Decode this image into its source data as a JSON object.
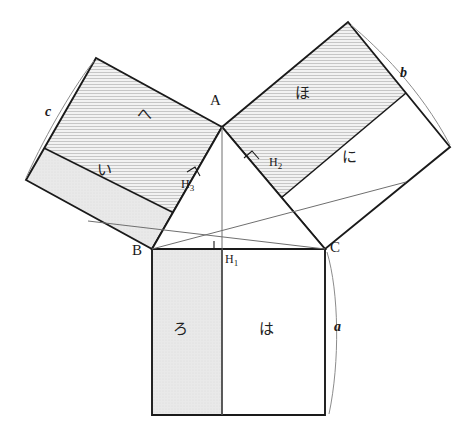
{
  "figure": {
    "canvas": {
      "width": 466,
      "height": 435,
      "background": "#ffffff"
    }
  },
  "colors": {
    "stroke_heavy": "#1a1a1a",
    "stroke_light": "#777777",
    "fill_white": "#ffffff",
    "fill_shaded": "#e6e6e6",
    "fill_hatched": "#ececec",
    "hatch_line": "#9a9a9a",
    "text": "#1a1a1a"
  },
  "vertices": [
    {
      "name": "A",
      "label": "A",
      "x": 222,
      "y": 127,
      "label_x": 214,
      "label_y": 100
    },
    {
      "name": "B",
      "label": "B",
      "x": 152,
      "y": 249,
      "label_x": 135,
      "label_y": 252
    },
    {
      "name": "C",
      "label": "C",
      "x": 325,
      "y": 249,
      "label_x": 330,
      "label_y": 249
    }
  ],
  "feet": [
    {
      "name": "H1",
      "label": "H",
      "sub": "1",
      "x": 222,
      "y": 249,
      "label_x": 226,
      "label_y": 254
    },
    {
      "name": "H2",
      "label": "H",
      "sub": "2",
      "x": 259,
      "y": 166,
      "label_x": 269,
      "label_y": 158
    },
    {
      "name": "H3",
      "label": "H",
      "sub": "3",
      "x": 196,
      "y": 182,
      "label_x": 190,
      "label_y": 183
    }
  ],
  "orthocenter": {
    "x": 222,
    "y": 193
  },
  "side_labels": [
    {
      "name": "a",
      "text": "a",
      "x": 334,
      "y": 320,
      "side": "BC"
    },
    {
      "name": "b",
      "text": "b",
      "x": 400,
      "y": 68,
      "side": "CA"
    },
    {
      "name": "c",
      "text": "c",
      "x": 46,
      "y": 106,
      "side": "AB"
    }
  ],
  "region_labels": [
    {
      "name": "ro",
      "text": "ろ",
      "x": 179,
      "y": 330,
      "square": "bottom",
      "part": "left-shaded"
    },
    {
      "name": "ha",
      "text": "は",
      "x": 265,
      "y": 330,
      "square": "bottom",
      "part": "right-white"
    },
    {
      "name": "i",
      "text": "い",
      "x": 103,
      "y": 172,
      "square": "left",
      "part": "lower-shaded"
    },
    {
      "name": "he",
      "text": "へ",
      "x": 143,
      "y": 116,
      "square": "left",
      "part": "upper-hatched"
    },
    {
      "name": "ho",
      "text": "ほ",
      "x": 301,
      "y": 95,
      "square": "right",
      "part": "upper-hatched"
    },
    {
      "name": "ni",
      "text": "に",
      "x": 348,
      "y": 158,
      "square": "right",
      "part": "lower-white"
    }
  ],
  "shapes": {
    "bottom_square": {
      "points": "152,249 325,249 325,415 152,415",
      "divider": "222,249 222,415",
      "left_part": "152,249 222,249 222,415 152,415",
      "right_part": "222,249 325,249 325,415 222,415"
    },
    "left_square": {
      "points": "152,249 222,127 96,58 26,180",
      "divider": "96,58 26,180",
      "inner_divider": "174,110 104,232",
      "upper_part": "152,249 222,127 96,58 26,180",
      "lower_part": "26,180 96,58 152,249"
    },
    "right_square": {
      "points": "222,127 325,249 450,147 348,22",
      "divider": "348,22 450,147",
      "inner_divider": "286,78 389,200",
      "upper_part": "222,127 348,22 450,147 325,249",
      "lower_part": "222,127 325,249 450,147 348,22"
    },
    "triangle": "222,127 152,249 325,249",
    "cevians": [
      {
        "name": "altitude-A-H1",
        "from": "222,127",
        "to": "222,249"
      },
      {
        "name": "cevian-B-H2",
        "from": "152,249",
        "to": "259,166"
      },
      {
        "name": "cevian-C-H3",
        "from": "325,249",
        "to": "196,182"
      },
      {
        "name": "extend-B-H2-far",
        "from": "259,166",
        "to": "389,200"
      },
      {
        "name": "extend-C-H3-far",
        "from": "196,182",
        "to": "104,232"
      }
    ],
    "right_angle_marks": [
      {
        "name": "right-angle-H1",
        "x": 222,
        "y": 249,
        "rot": 0
      },
      {
        "name": "right-angle-H2",
        "x": 259,
        "y": 166,
        "rot": 38
      },
      {
        "name": "right-angle-H3",
        "x": 196,
        "y": 182,
        "rot": -60
      }
    ],
    "braces": [
      {
        "name": "brace-a",
        "path": "M327,252 C337,290 338,360 328,414"
      },
      {
        "name": "brace-b",
        "path": "M351,25 C375,45 418,85 449,144"
      },
      {
        "name": "brace-c",
        "path": "M94,61 C78,80 48,130 27,177"
      }
    ]
  }
}
